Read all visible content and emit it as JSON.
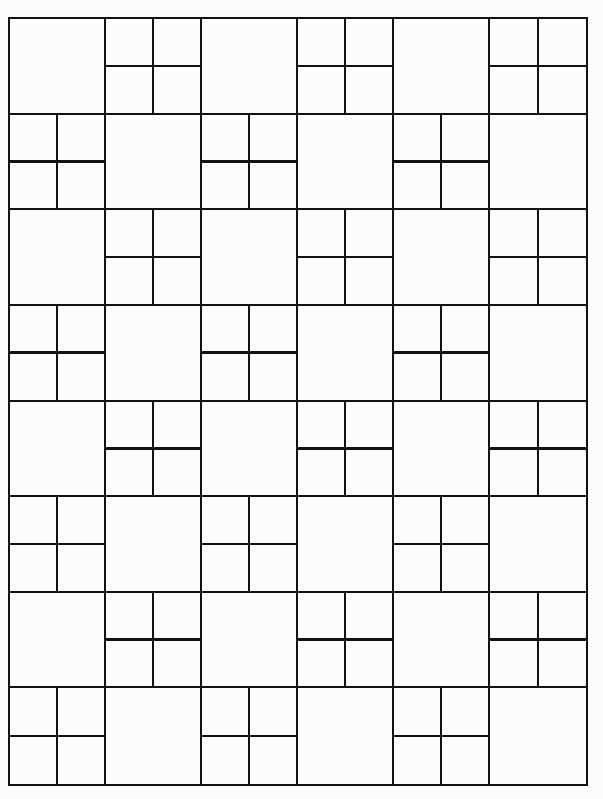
{
  "diagram": {
    "title": "",
    "rows": 8,
    "cols": 6,
    "line_color": "#111111",
    "background_color": "#fcfcfb",
    "split_rule": "cell is split into four when (row + col) is odd",
    "cells": [
      [
        "plain",
        "split",
        "plain",
        "split",
        "plain",
        "split"
      ],
      [
        "split",
        "plain",
        "split",
        "plain",
        "split",
        "plain"
      ],
      [
        "plain",
        "split",
        "plain",
        "split",
        "plain",
        "split"
      ],
      [
        "split",
        "plain",
        "split",
        "plain",
        "split",
        "plain"
      ],
      [
        "plain",
        "split",
        "plain",
        "split",
        "plain",
        "split"
      ],
      [
        "split",
        "plain",
        "split",
        "plain",
        "split",
        "plain"
      ],
      [
        "plain",
        "split",
        "plain",
        "split",
        "plain",
        "split"
      ],
      [
        "split",
        "plain",
        "split",
        "plain",
        "split",
        "plain"
      ]
    ]
  }
}
